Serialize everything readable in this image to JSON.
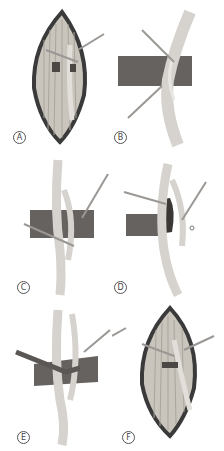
{
  "figure": {
    "panels": [
      {
        "id": "A",
        "label": "A",
        "content": "incision-with-muscle-and-nerve"
      },
      {
        "id": "B",
        "label": "B",
        "content": "nerve-with-band-and-retractor"
      },
      {
        "id": "C",
        "label": "C",
        "content": "nerve-split-around-band"
      },
      {
        "id": "D",
        "label": "D",
        "content": "band-retracted-with-hook"
      },
      {
        "id": "E",
        "label": "E",
        "content": "band-cut-with-instrument"
      },
      {
        "id": "F",
        "label": "F",
        "content": "incision-repair"
      }
    ],
    "colors": {
      "skin_edge": "#3a3a3a",
      "muscle": "#c9c4bc",
      "nerve": "#d6d3ce",
      "band": "#4a4744",
      "instrument": "#9a9794",
      "label_border": "#555555"
    }
  }
}
